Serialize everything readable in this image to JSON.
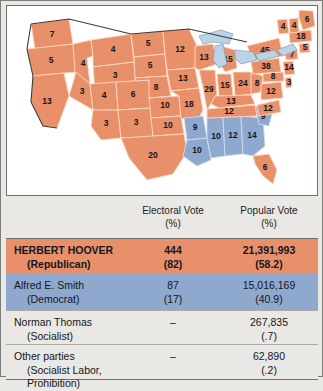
{
  "map": {
    "title": "1928 presidential election electoral map",
    "legend_colors": {
      "republican": "#e8906a",
      "democrat": "#8ea9cd",
      "lake": "#bcd3e6"
    },
    "states": [
      {
        "code": "WA",
        "label": "7",
        "party": "republican"
      },
      {
        "code": "OR",
        "label": "5",
        "party": "republican"
      },
      {
        "code": "CA",
        "label": "13",
        "party": "republican"
      },
      {
        "code": "ID",
        "label": "4",
        "party": "republican"
      },
      {
        "code": "NV",
        "label": "3",
        "party": "republican"
      },
      {
        "code": "MT",
        "label": "4",
        "party": "republican"
      },
      {
        "code": "WY",
        "label": "3",
        "party": "republican"
      },
      {
        "code": "UT",
        "label": "4",
        "party": "republican"
      },
      {
        "code": "AZ",
        "label": "3",
        "party": "republican"
      },
      {
        "code": "CO",
        "label": "6",
        "party": "republican"
      },
      {
        "code": "NM",
        "label": "3",
        "party": "republican"
      },
      {
        "code": "ND",
        "label": "5",
        "party": "republican"
      },
      {
        "code": "SD",
        "label": "5",
        "party": "republican"
      },
      {
        "code": "NE",
        "label": "8",
        "party": "republican"
      },
      {
        "code": "KS",
        "label": "10",
        "party": "republican"
      },
      {
        "code": "OK",
        "label": "10",
        "party": "republican"
      },
      {
        "code": "TX",
        "label": "20",
        "party": "republican"
      },
      {
        "code": "MN",
        "label": "12",
        "party": "republican"
      },
      {
        "code": "IA",
        "label": "13",
        "party": "republican"
      },
      {
        "code": "MO",
        "label": "18",
        "party": "republican"
      },
      {
        "code": "AR",
        "label": "9",
        "party": "democrat"
      },
      {
        "code": "LA",
        "label": "10",
        "party": "democrat"
      },
      {
        "code": "MS",
        "label": "10",
        "party": "democrat"
      },
      {
        "code": "AL",
        "label": "12",
        "party": "democrat"
      },
      {
        "code": "GA",
        "label": "14",
        "party": "democrat"
      },
      {
        "code": "SC",
        "label": "9",
        "party": "democrat"
      },
      {
        "code": "WI",
        "label": "13",
        "party": "republican"
      },
      {
        "code": "IL",
        "label": "29",
        "party": "republican"
      },
      {
        "code": "MI",
        "label": "15",
        "party": "republican"
      },
      {
        "code": "IN",
        "label": "15",
        "party": "republican"
      },
      {
        "code": "OH",
        "label": "24",
        "party": "republican"
      },
      {
        "code": "KY",
        "label": "13",
        "party": "republican"
      },
      {
        "code": "TN",
        "label": "12",
        "party": "republican"
      },
      {
        "code": "NC",
        "label": "12",
        "party": "republican"
      },
      {
        "code": "FL",
        "label": "6",
        "party": "republican"
      },
      {
        "code": "WV",
        "label": "8",
        "party": "republican"
      },
      {
        "code": "VA",
        "label": "12",
        "party": "republican"
      },
      {
        "code": "MD",
        "label": "8",
        "party": "republican"
      },
      {
        "code": "DE",
        "label": "3",
        "party": "republican"
      },
      {
        "code": "PA",
        "label": "38",
        "party": "republican"
      },
      {
        "code": "NY",
        "label": "45",
        "party": "republican"
      },
      {
        "code": "NJ",
        "label": "14",
        "party": "republican"
      },
      {
        "code": "CT",
        "label": "7",
        "party": "republican"
      },
      {
        "code": "RI",
        "label": "5",
        "party": "republican"
      },
      {
        "code": "MA",
        "label": "18",
        "party": "republican"
      },
      {
        "code": "VT",
        "label": "4",
        "party": "republican"
      },
      {
        "code": "NH",
        "label": "4",
        "party": "republican"
      },
      {
        "code": "ME",
        "label": "6",
        "party": "republican"
      }
    ]
  },
  "table": {
    "headers": {
      "electoral": "Electoral Vote",
      "electoral_pct": "(%)",
      "popular": "Popular Vote",
      "popular_pct": "(%)"
    },
    "rows": [
      {
        "name": "HERBERT HOOVER",
        "party": "(Republican)",
        "electoral": "444",
        "electoral_pct": "(82)",
        "popular": "21,391,993",
        "popular_pct": "(58.2)",
        "color": "#e8906a"
      },
      {
        "name": "Alfred E. Smith",
        "party": "(Democrat)",
        "electoral": "87",
        "electoral_pct": "(17)",
        "popular": "15,016,169",
        "popular_pct": "(40.9)",
        "color": "#8ea9cd"
      },
      {
        "name": "Norman Thomas",
        "party": "(Socialist)",
        "electoral": "–",
        "electoral_pct": "",
        "popular": "267,835",
        "popular_pct": "(.7)",
        "color": "#e9e8e4"
      },
      {
        "name": "Other parties",
        "party": "(Socialist Labor, Prohibition)",
        "electoral": "–",
        "electoral_pct": "",
        "popular": "62,890",
        "popular_pct": "(.2)",
        "color": "#e9e8e4"
      }
    ]
  }
}
